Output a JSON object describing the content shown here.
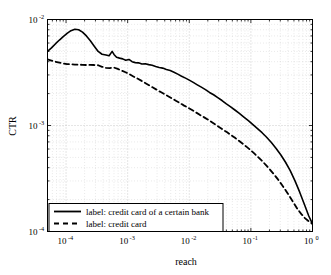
{
  "chart_data": {
    "type": "line",
    "title": "",
    "xlabel": "reach",
    "ylabel": "CTR",
    "xscale": "log",
    "yscale": "log",
    "xlim": [
      5e-05,
      1.0
    ],
    "ylim": [
      0.0001,
      0.01
    ],
    "grid": true,
    "grid_style": "dotted-minor-and-major",
    "legend_position": "lower-left",
    "xticks": [
      {
        "value": 0.0001,
        "mantissa": "10",
        "exponent": "-4"
      },
      {
        "value": 0.001,
        "mantissa": "10",
        "exponent": "-3"
      },
      {
        "value": 0.01,
        "mantissa": "10",
        "exponent": "-2"
      },
      {
        "value": 0.1,
        "mantissa": "10",
        "exponent": "-1"
      },
      {
        "value": 1.0,
        "mantissa": "10",
        "exponent": "0"
      }
    ],
    "yticks": [
      {
        "value": 0.0001,
        "mantissa": "10",
        "exponent": "-4"
      },
      {
        "value": 0.001,
        "mantissa": "10",
        "exponent": "-3"
      },
      {
        "value": 0.01,
        "mantissa": "10",
        "exponent": "-2"
      }
    ],
    "series": [
      {
        "name": "label: credit card of a certain bank",
        "style": "solid",
        "color": "#000000",
        "linewidth": 1.6,
        "points": [
          [
            5e-05,
            0.005
          ],
          [
            5.8e-05,
            0.0054
          ],
          [
            6.7e-05,
            0.00588
          ],
          [
            7.8e-05,
            0.0064
          ],
          [
            9e-05,
            0.0069
          ],
          [
            0.000104,
            0.0074
          ],
          [
            0.00012,
            0.00785
          ],
          [
            0.000139,
            0.0081
          ],
          [
            0.00016,
            0.008
          ],
          [
            0.000185,
            0.0076
          ],
          [
            0.000214,
            0.007
          ],
          [
            0.000248,
            0.0063
          ],
          [
            0.000287,
            0.0056
          ],
          [
            0.000332,
            0.005
          ],
          [
            0.000384,
            0.0047
          ],
          [
            0.000445,
            0.00462
          ],
          [
            0.0005,
            0.00455
          ],
          [
            0.00056,
            0.005
          ],
          [
            0.0006,
            0.00468
          ],
          [
            0.00066,
            0.0044
          ],
          [
            0.00074,
            0.00432
          ],
          [
            0.00083,
            0.00425
          ],
          [
            0.00093,
            0.00412
          ],
          [
            0.00105,
            0.0042
          ],
          [
            0.00118,
            0.004
          ],
          [
            0.00133,
            0.00392
          ],
          [
            0.0015,
            0.0039
          ],
          [
            0.0017,
            0.0038
          ],
          [
            0.00193,
            0.00382
          ],
          [
            0.0022,
            0.00375
          ],
          [
            0.0025,
            0.0037
          ],
          [
            0.00285,
            0.0036
          ],
          [
            0.00325,
            0.00352
          ],
          [
            0.0037,
            0.00348
          ],
          [
            0.00425,
            0.00338
          ],
          [
            0.0049,
            0.0033
          ],
          [
            0.00565,
            0.00318
          ],
          [
            0.0065,
            0.00305
          ],
          [
            0.0075,
            0.00292
          ],
          [
            0.0087,
            0.0028
          ],
          [
            0.01,
            0.00268
          ],
          [
            0.0116,
            0.00255
          ],
          [
            0.0135,
            0.00242
          ],
          [
            0.0157,
            0.0023
          ],
          [
            0.0183,
            0.00218
          ],
          [
            0.0213,
            0.00205
          ],
          [
            0.0248,
            0.00195
          ],
          [
            0.029,
            0.00183
          ],
          [
            0.034,
            0.00172
          ],
          [
            0.04,
            0.0016
          ],
          [
            0.047,
            0.0015
          ],
          [
            0.055,
            0.0014
          ],
          [
            0.065,
            0.0013
          ],
          [
            0.077,
            0.0012
          ],
          [
            0.091,
            0.00111
          ],
          [
            0.108,
            0.00102
          ],
          [
            0.128,
            0.000935
          ],
          [
            0.152,
            0.000855
          ],
          [
            0.18,
            0.000775
          ],
          [
            0.215,
            0.00069
          ],
          [
            0.255,
            0.00061
          ],
          [
            0.305,
            0.00053
          ],
          [
            0.365,
            0.00045
          ],
          [
            0.435,
            0.000375
          ],
          [
            0.52,
            0.0003
          ],
          [
            0.62,
            0.000235
          ],
          [
            0.74,
            0.00018
          ],
          [
            0.87,
            0.00014
          ],
          [
            1.0,
            0.000118
          ]
        ]
      },
      {
        "name": "label: credit card",
        "style": "dashed",
        "color": "#000000",
        "linewidth": 1.8,
        "points": [
          [
            5e-05,
            0.0042
          ],
          [
            5.8e-05,
            0.0041
          ],
          [
            6.7e-05,
            0.004
          ],
          [
            7.8e-05,
            0.00392
          ],
          [
            9e-05,
            0.00385
          ],
          [
            0.000104,
            0.0038
          ],
          [
            0.00012,
            0.00378
          ],
          [
            0.000139,
            0.00376
          ],
          [
            0.00016,
            0.00375
          ],
          [
            0.000185,
            0.00374
          ],
          [
            0.000214,
            0.00372
          ],
          [
            0.000248,
            0.00374
          ],
          [
            0.000287,
            0.00372
          ],
          [
            0.000332,
            0.0037
          ],
          [
            0.000384,
            0.00358
          ],
          [
            0.000445,
            0.0035
          ],
          [
            0.000515,
            0.00348
          ],
          [
            0.000596,
            0.00352
          ],
          [
            0.00069,
            0.00342
          ],
          [
            0.000798,
            0.0033
          ],
          [
            0.000923,
            0.00318
          ],
          [
            0.00107,
            0.00305
          ],
          [
            0.00124,
            0.0029
          ],
          [
            0.00143,
            0.00278
          ],
          [
            0.00166,
            0.00265
          ],
          [
            0.00192,
            0.00252
          ],
          [
            0.00222,
            0.0024
          ],
          [
            0.00257,
            0.00228
          ],
          [
            0.00297,
            0.00217
          ],
          [
            0.00344,
            0.00207
          ],
          [
            0.00398,
            0.00197
          ],
          [
            0.00461,
            0.00188
          ],
          [
            0.00533,
            0.00179
          ],
          [
            0.00617,
            0.0017
          ],
          [
            0.00714,
            0.00162
          ],
          [
            0.00826,
            0.00154
          ],
          [
            0.00956,
            0.00147
          ],
          [
            0.0111,
            0.0014
          ],
          [
            0.0128,
            0.00133
          ],
          [
            0.0148,
            0.00126
          ],
          [
            0.0172,
            0.0012
          ],
          [
            0.0199,
            0.00114
          ],
          [
            0.023,
            0.00108
          ],
          [
            0.0266,
            0.00102
          ],
          [
            0.0308,
            0.000965
          ],
          [
            0.0356,
            0.000912
          ],
          [
            0.0412,
            0.000862
          ],
          [
            0.0477,
            0.000812
          ],
          [
            0.0552,
            0.000765
          ],
          [
            0.0639,
            0.000718
          ],
          [
            0.0739,
            0.000672
          ],
          [
            0.0855,
            0.000628
          ],
          [
            0.099,
            0.000585
          ],
          [
            0.1145,
            0.000542
          ],
          [
            0.1325,
            0.0005
          ],
          [
            0.1535,
            0.00046
          ],
          [
            0.1775,
            0.00042
          ],
          [
            0.2055,
            0.000382
          ],
          [
            0.238,
            0.000345
          ],
          [
            0.275,
            0.00031
          ],
          [
            0.318,
            0.000276
          ],
          [
            0.368,
            0.000244
          ],
          [
            0.426,
            0.000214
          ],
          [
            0.493,
            0.000187
          ],
          [
            0.57,
            0.000163
          ],
          [
            0.66,
            0.000146
          ],
          [
            0.76,
            0.000133
          ],
          [
            0.88,
            0.000124
          ],
          [
            1.0,
            0.000118
          ]
        ]
      }
    ]
  },
  "legend": {
    "entries": [
      {
        "label": "label: credit card of a certain bank",
        "style": "solid"
      },
      {
        "label": "label: credit card",
        "style": "dashed"
      }
    ]
  },
  "axes": {
    "x_title": "reach",
    "y_title": "CTR"
  },
  "colors": {
    "line": "#000000",
    "grid": "#b4b4b4",
    "axis": "#000000",
    "background": "#ffffff"
  }
}
